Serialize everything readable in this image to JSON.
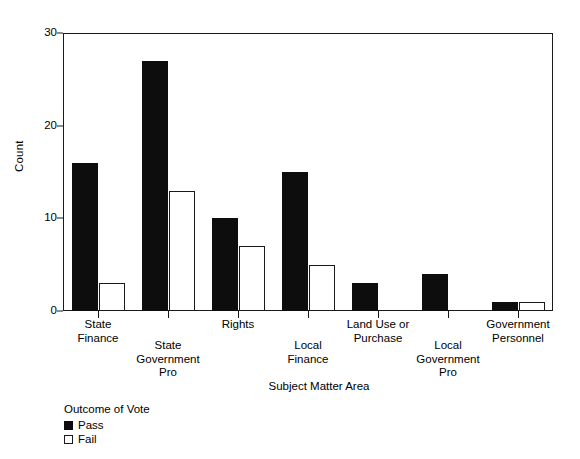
{
  "chart_data": {
    "type": "bar",
    "title": "",
    "xlabel": "Subject Matter Area",
    "ylabel": "Count",
    "ylim": [
      0,
      30
    ],
    "yticks": [
      0,
      10,
      20,
      30
    ],
    "ytick_labels": [
      "0",
      "10",
      "20",
      "30"
    ],
    "grid": false,
    "legend_title": "Outcome of Vote",
    "legend_position": "below-left",
    "categories": [
      "State\nFinance",
      "State\nGovernment\nPro",
      "Rights",
      "Local\nFinance",
      "Land Use or\nPurchase",
      "Local\nGovernment\nPro",
      "Government\nPersonnel"
    ],
    "series": [
      {
        "name": "Pass",
        "color": "#0d0d0d",
        "values": [
          16,
          27,
          10,
          15,
          3,
          4,
          1
        ]
      },
      {
        "name": "Fail",
        "color": "#ffffff",
        "values": [
          3,
          13,
          7,
          5,
          0,
          0,
          1
        ]
      }
    ]
  },
  "axis": {
    "y_title": "Count",
    "x_title": "Subject Matter Area",
    "y_ticks": [
      "0",
      "10",
      "20",
      "30"
    ]
  },
  "legend": {
    "title": "Outcome of Vote",
    "items": [
      {
        "label": "Pass",
        "swatch": "filled-black-square"
      },
      {
        "label": "Fail",
        "swatch": "open-white-square"
      }
    ]
  }
}
